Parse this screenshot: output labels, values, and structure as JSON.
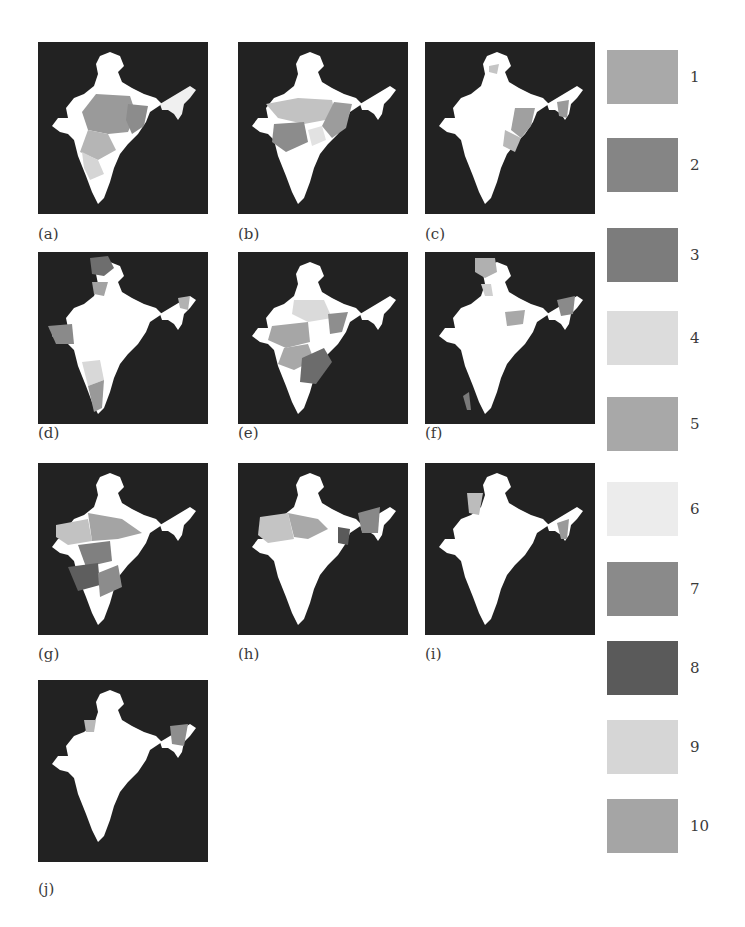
{
  "figure": {
    "panels": [
      {
        "id": "a",
        "label": "(a)"
      },
      {
        "id": "b",
        "label": "(b)"
      },
      {
        "id": "c",
        "label": "(c)"
      },
      {
        "id": "d",
        "label": "(d)"
      },
      {
        "id": "e",
        "label": "(e)"
      },
      {
        "id": "f",
        "label": "(f)"
      },
      {
        "id": "g",
        "label": "(g)"
      },
      {
        "id": "h",
        "label": "(h)"
      },
      {
        "id": "i",
        "label": "(i)"
      },
      {
        "id": "j",
        "label": "(j)"
      }
    ],
    "legend": [
      {
        "label": "1",
        "color": "#a9a9a9"
      },
      {
        "label": "2",
        "color": "#858585"
      },
      {
        "label": "3",
        "color": "#7c7c7c"
      },
      {
        "label": "4",
        "color": "#dcdcdc"
      },
      {
        "label": "5",
        "color": "#a8a8a8"
      },
      {
        "label": "6",
        "color": "#ececec"
      },
      {
        "label": "7",
        "color": "#8a8a8a"
      },
      {
        "label": "8",
        "color": "#5a5a5a"
      },
      {
        "label": "9",
        "color": "#d6d6d6"
      },
      {
        "label": "10",
        "color": "#a5a5a5"
      }
    ],
    "colors": {
      "background": "#222222",
      "land": "#ffffff"
    }
  }
}
